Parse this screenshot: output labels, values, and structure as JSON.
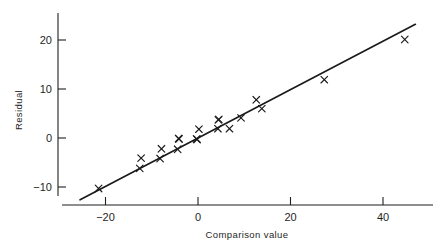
{
  "chart_data": {
    "type": "scatter",
    "title": "",
    "xlabel": "Comparison value",
    "ylabel": "Residual",
    "xlim": [
      -27,
      48
    ],
    "ylim": [
      -14,
      25
    ],
    "grid": false,
    "legend": null,
    "xticks": [
      -20,
      0,
      20,
      40
    ],
    "xtick_labels": [
      "−20",
      "0",
      "20",
      "40"
    ],
    "yticks": [
      -10,
      0,
      10,
      20
    ],
    "ytick_labels": [
      "−10",
      "0",
      "10",
      "20"
    ],
    "marker": "x",
    "reference_line": {
      "type": "line",
      "x": [
        -25.5,
        47.0
      ],
      "y": [
        -12.6,
        23.2
      ],
      "slope": 0.494,
      "intercept": -0.01
    },
    "points": [
      {
        "x": -21.5,
        "y": -10.3
      },
      {
        "x": -12.6,
        "y": -6.2
      },
      {
        "x": -12.3,
        "y": -4.1
      },
      {
        "x": -8.2,
        "y": -4.2
      },
      {
        "x": -7.9,
        "y": -2.2
      },
      {
        "x": -4.4,
        "y": -2.3
      },
      {
        "x": -4.2,
        "y": -0.1
      },
      {
        "x": -4.1,
        "y": -0.2
      },
      {
        "x": -0.3,
        "y": -0.2
      },
      {
        "x": -0.2,
        "y": -0.3
      },
      {
        "x": 0.2,
        "y": 1.8
      },
      {
        "x": 4.3,
        "y": 1.9
      },
      {
        "x": 4.4,
        "y": 3.7
      },
      {
        "x": 4.5,
        "y": 3.8
      },
      {
        "x": 6.8,
        "y": 1.9
      },
      {
        "x": 9.3,
        "y": 4.1
      },
      {
        "x": 12.6,
        "y": 7.8
      },
      {
        "x": 13.8,
        "y": 6.0
      },
      {
        "x": 27.3,
        "y": 11.9
      },
      {
        "x": 44.7,
        "y": 20.1
      }
    ]
  },
  "axes": {
    "y_label": "Residual",
    "x_label": "Comparison value"
  }
}
